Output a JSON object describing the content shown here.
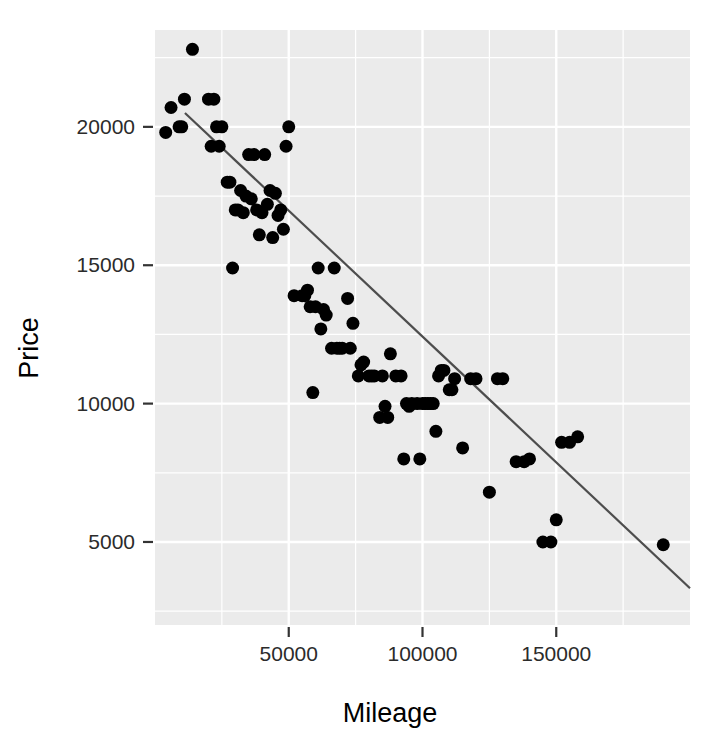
{
  "chart_data": {
    "type": "scatter",
    "title": "",
    "xlabel": "Mileage",
    "ylabel": "Price",
    "xlim": [
      0,
      200000
    ],
    "ylim": [
      2000,
      23500
    ],
    "grid": true,
    "legend": false,
    "x_ticks": [
      50000,
      100000,
      150000
    ],
    "x_tick_labels": [
      "50000",
      "100000",
      "150000"
    ],
    "y_ticks": [
      5000,
      10000,
      15000,
      20000
    ],
    "y_tick_labels": [
      "5000",
      "10000",
      "15000",
      "20000"
    ],
    "x_minor_ticks": [
      25000,
      75000,
      125000,
      175000
    ],
    "y_minor_ticks": [
      2500,
      7500,
      12500,
      17500,
      22500
    ],
    "point_color": "#000000",
    "point_size": 13,
    "panel_color": "#ebebeb",
    "grid_color": "#ffffff",
    "series": [
      {
        "name": "Cars",
        "x": [
          11000,
          14000,
          6000,
          9000,
          4000,
          10000,
          20000,
          22000,
          25000,
          23000,
          21000,
          24000,
          27000,
          28000,
          31000,
          30000,
          34000,
          36000,
          33000,
          38000,
          40000,
          42000,
          39000,
          44000,
          46000,
          43000,
          47000,
          45000,
          48000,
          35000,
          29000,
          32000,
          37000,
          41000,
          49000,
          50000,
          52000,
          55000,
          58000,
          60000,
          62000,
          57000,
          64000,
          66000,
          68000,
          70000,
          72000,
          63000,
          59000,
          67000,
          74000,
          76000,
          78000,
          80000,
          82000,
          85000,
          88000,
          90000,
          92000,
          94000,
          96000,
          98000,
          100000,
          102000,
          104000,
          106000,
          108000,
          110000,
          112000,
          105000,
          95000,
          87000,
          93000,
          99000,
          103000,
          115000,
          118000,
          120000,
          125000,
          128000,
          130000,
          135000,
          138000,
          140000,
          145000,
          148000,
          150000,
          152000,
          155000,
          158000,
          190000,
          101000,
          107000,
          111000,
          84000,
          86000,
          69000,
          73000,
          77000,
          81000,
          56000,
          61000
        ],
        "y": [
          21000,
          22800,
          20700,
          20000,
          19800,
          20000,
          21000,
          21000,
          20000,
          20000,
          19300,
          19300,
          18000,
          18000,
          17000,
          17000,
          17500,
          17400,
          16900,
          17000,
          16900,
          17200,
          16100,
          16000,
          16800,
          17700,
          17000,
          17600,
          16300,
          19000,
          14900,
          17700,
          19000,
          19000,
          19300,
          20000,
          13900,
          13900,
          13500,
          13500,
          12700,
          14100,
          13200,
          12000,
          12000,
          12000,
          13800,
          13400,
          10400,
          14900,
          12900,
          11000,
          11500,
          11000,
          11000,
          11000,
          11800,
          11000,
          11000,
          10000,
          10000,
          10000,
          10000,
          10000,
          10000,
          11000,
          11200,
          10500,
          10900,
          9000,
          9900,
          9500,
          8000,
          8000,
          10000,
          8400,
          10900,
          10900,
          6800,
          10900,
          10900,
          7900,
          7900,
          8000,
          5000,
          5000,
          5800,
          8600,
          8600,
          8800,
          4900,
          10000,
          11200,
          10500,
          9500,
          9900,
          12000,
          12000,
          11400,
          11000,
          13900,
          14900
        ]
      }
    ],
    "fit_line": {
      "name": "linear-fit",
      "x_start": 11200,
      "y_start": 20500,
      "x_end": 208000,
      "y_end": 2600,
      "color": "#4d4d4d"
    }
  }
}
